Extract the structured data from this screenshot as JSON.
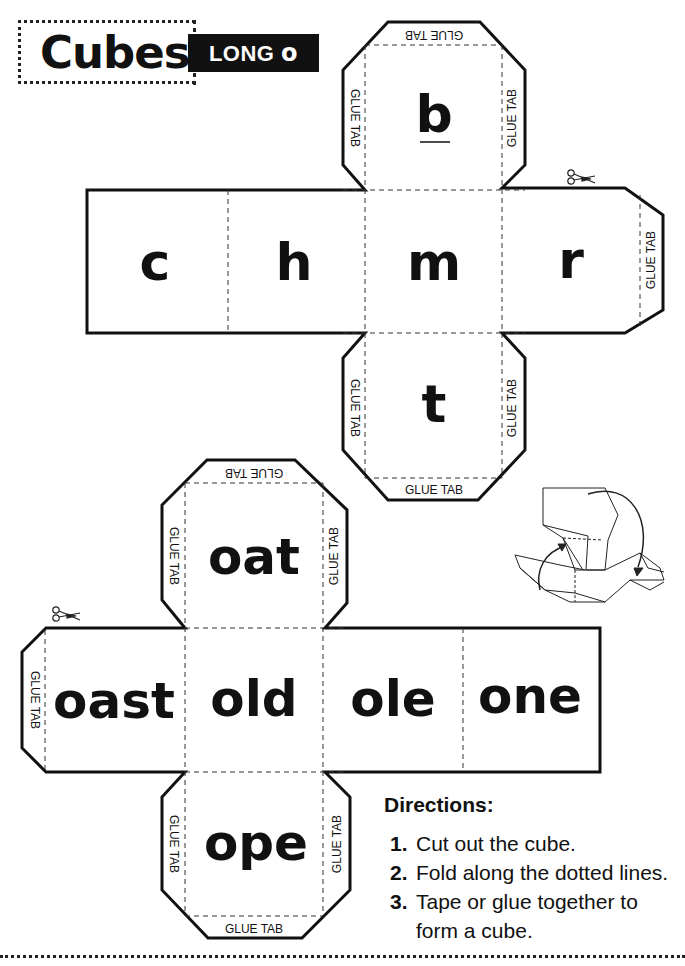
{
  "header": {
    "title": "Cubes",
    "badge_text": "LONG ",
    "badge_vowel": "o"
  },
  "glue_tab_label": "GLUE TAB",
  "cube1": {
    "top_face": "b",
    "left_faces": [
      "c",
      "h"
    ],
    "center_face": "m",
    "right_face": "r",
    "bottom_face": "t"
  },
  "cube2": {
    "top_face": "oat",
    "left_face": "oast",
    "center_face": "old",
    "right_faces": [
      "ole",
      "one"
    ],
    "bottom_face": "ope"
  },
  "directions": {
    "title": "Directions:",
    "steps": [
      {
        "num": "1.",
        "text": "Cut out the cube."
      },
      {
        "num": "2.",
        "text": "Fold along the dotted lines."
      },
      {
        "num": "3.",
        "text": "Tape or glue together to form a cube."
      }
    ]
  },
  "icons": {
    "scissors": "scissors-icon",
    "fold_illustration": "cube-folding-illustration"
  },
  "colors": {
    "ink": "#111111",
    "paper": "#ffffff",
    "badge_bg": "#111111",
    "badge_fg": "#ffffff"
  }
}
